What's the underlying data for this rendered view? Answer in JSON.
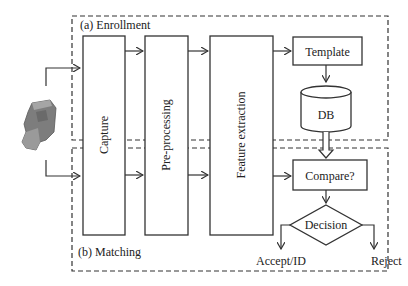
{
  "diagram": {
    "regions": {
      "enrollment_label": "(a) Enrollment",
      "matching_label": "(b) Matching"
    },
    "blocks": {
      "capture": "Capture",
      "preprocessing": "Pre-processing",
      "feature_extraction": "Feature extraction",
      "template": "Template",
      "db": "DB",
      "compare": "Compare?",
      "decision": "Decision"
    },
    "outcomes": {
      "accept": "Accept/ID",
      "reject": "Reject"
    },
    "input_device": "fingerprint-scanner",
    "colors": {
      "stroke": "#333333",
      "background": "#ffffff",
      "device": "#8a8a8a"
    }
  }
}
